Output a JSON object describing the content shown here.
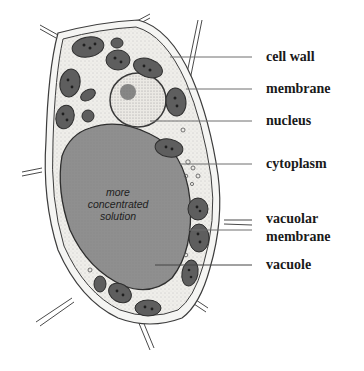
{
  "diagram": {
    "type": "labeled-illustration",
    "colors": {
      "background": "#ffffff",
      "cell_wall_fill": "#f4f4f2",
      "cytoplasm_fill": "#ecebe7",
      "vacuole_fill": "#8e8e8e",
      "outline": "#3a3a3a",
      "chloroplast_fill": "#6a6a6a",
      "leader_line": "#6f6f6f",
      "label_text": "#1a1a1a"
    },
    "vacuole_text": {
      "line1": "more",
      "line2": "concentrated",
      "line3": "solution"
    },
    "labels": [
      {
        "id": "cell-wall",
        "text": "cell wall"
      },
      {
        "id": "membrane",
        "text": "membrane"
      },
      {
        "id": "nucleus",
        "text": "nucleus"
      },
      {
        "id": "cytoplasm",
        "text": "cytoplasm"
      },
      {
        "id": "vacuolar-membrane",
        "text": "vacuolar",
        "text2": "membrane"
      },
      {
        "id": "vacuole",
        "text": "vacuole"
      }
    ]
  }
}
